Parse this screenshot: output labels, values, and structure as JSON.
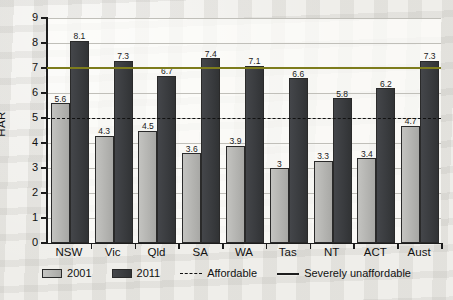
{
  "chart_data": {
    "type": "bar",
    "title": "",
    "xlabel": "",
    "ylabel": "HAR",
    "ylim": [
      0,
      9
    ],
    "ytick_labels": [
      "9",
      "8",
      "7",
      "6",
      "5",
      "4",
      "3",
      "2",
      "1",
      "0"
    ],
    "grid": true,
    "legend_position": "bottom",
    "categories": [
      "NSW",
      "Vic",
      "Qld",
      "SA",
      "WA",
      "Tas",
      "NT",
      "ACT",
      "Aust"
    ],
    "series": [
      {
        "name": "2001",
        "color": "#b4b4b1",
        "values": [
          5.6,
          4.3,
          4.5,
          3.6,
          3.9,
          3,
          3.3,
          3.4,
          4.7
        ],
        "labels": [
          "5.6",
          "4.3",
          "4.5",
          "3.6",
          "3.9",
          "3",
          "3.3",
          "3.4",
          "4.7"
        ]
      },
      {
        "name": "2011",
        "color": "#393b3e",
        "values": [
          8.1,
          7.3,
          6.7,
          7.4,
          7.1,
          6.6,
          5.8,
          6.2,
          7.3
        ],
        "labels": [
          "8.1",
          "7.3",
          "6.7",
          "7.4",
          "7.1",
          "6.6",
          "5.8",
          "6.2",
          "7.3"
        ]
      }
    ],
    "reference_lines": [
      {
        "name": "Affordable",
        "value": 5,
        "style": "dashed",
        "color": "#111111"
      },
      {
        "name": "Severely unaffordable",
        "value": 7,
        "style": "solid",
        "color": "#7d7c1c"
      }
    ]
  },
  "legend": {
    "items": [
      {
        "label": "2001",
        "marker": "swatch-light"
      },
      {
        "label": "2011",
        "marker": "swatch-dark"
      },
      {
        "label": "Affordable",
        "marker": "dashed-line"
      },
      {
        "label": "Severely unaffordable",
        "marker": "solid-line"
      }
    ]
  }
}
